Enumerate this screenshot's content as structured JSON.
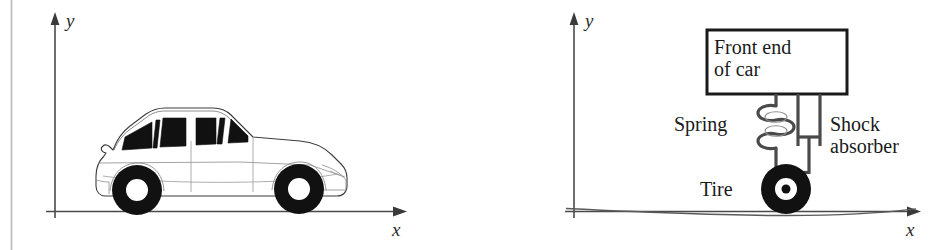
{
  "figure": {
    "caption": "",
    "panels": [
      {
        "id": "left-panel",
        "name": "car-on-road-panel",
        "axes": {
          "x_label": "x",
          "y_label": "y"
        },
        "subject": "car",
        "labels": []
      },
      {
        "id": "right-panel",
        "name": "suspension-schematic-panel",
        "axes": {
          "x_label": "x",
          "y_label": "y"
        },
        "subject": "suspension-model",
        "labels": [
          {
            "key": "body",
            "line1": "Front end",
            "line2": "of car"
          },
          {
            "key": "spring",
            "line1": "Spring",
            "line2": ""
          },
          {
            "key": "shock",
            "line1": "Shock",
            "line2": "absorber"
          },
          {
            "key": "tire",
            "line1": "Tire",
            "line2": ""
          }
        ]
      }
    ]
  },
  "colors": {
    "ink": "#1a1a1a",
    "axis": "#4a4a4a",
    "outline": "#3c3c3c",
    "fill_black": "#111111",
    "paper": "#ffffff",
    "gutter": "#b5b5b5",
    "metal": "#555555"
  }
}
